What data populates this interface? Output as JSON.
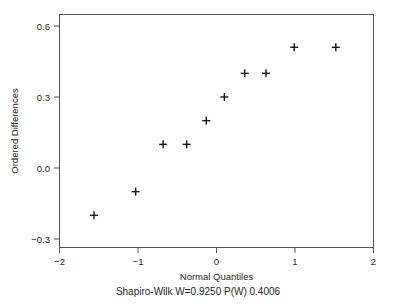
{
  "chart_data": {
    "type": "scatter",
    "title": "",
    "subtitle": "",
    "xlabel": "Normal Quantiles",
    "ylabel": "Ordered Differences",
    "caption": "Shapiro-Wilk W=0.9250  P(W) 0.4006",
    "xlim": [
      -2.0,
      2.0
    ],
    "ylim": [
      -0.3,
      0.6
    ],
    "xticks": [
      -2,
      -1,
      0,
      1,
      2
    ],
    "xtick_labels": [
      "−2",
      "−1",
      "0",
      "1",
      "2"
    ],
    "yticks": [
      -0.3,
      0.0,
      0.3,
      0.6
    ],
    "ytick_labels": [
      "−0.3",
      "0.0",
      "0.3",
      "0.6"
    ],
    "grid": false,
    "legend": false,
    "marker": "plus",
    "marker_color": "#151515",
    "frame_color": "#555555",
    "background": "#ffffff",
    "x": [
      -1.56,
      -1.03,
      -0.68,
      -0.38,
      -0.13,
      0.1,
      0.36,
      0.63,
      0.99,
      1.52
    ],
    "y": [
      -0.2,
      -0.1,
      0.1,
      0.1,
      0.2,
      0.3,
      0.4,
      0.4,
      0.51,
      0.51
    ],
    "points": [
      {
        "x": -1.56,
        "y": -0.2
      },
      {
        "x": -1.03,
        "y": -0.1
      },
      {
        "x": -0.68,
        "y": 0.1
      },
      {
        "x": -0.38,
        "y": 0.1
      },
      {
        "x": -0.13,
        "y": 0.2
      },
      {
        "x": 0.1,
        "y": 0.3
      },
      {
        "x": 0.36,
        "y": 0.4
      },
      {
        "x": 0.63,
        "y": 0.4
      },
      {
        "x": 0.99,
        "y": 0.51
      },
      {
        "x": 1.52,
        "y": 0.51
      }
    ],
    "statistics": {
      "test_name": "Shapiro-Wilk",
      "W_label": "W=",
      "W": "0.9250",
      "P_label": "P(W)",
      "P": "0.4006"
    }
  },
  "axes": {
    "x_tick_0": "−2",
    "x_tick_1": "−1",
    "x_tick_2": "0",
    "x_tick_3": "1",
    "x_tick_4": "2",
    "y_tick_0": "0.6",
    "y_tick_1": "0.3",
    "y_tick_2": "0.0",
    "y_tick_3": "−0.3",
    "x_title": "Normal Quantiles",
    "y_title": "Ordered Differences"
  },
  "footer": {
    "caption": "Shapiro-Wilk W=0.9250  P(W) 0.4006"
  }
}
